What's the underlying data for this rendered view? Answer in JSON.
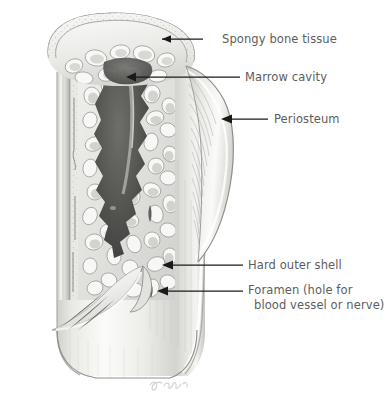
{
  "figure": {
    "signature": "J. Bonn",
    "background_color": "#ffffff",
    "ink_color": "#5d5d5d",
    "leader_color": "#1a1a1a"
  },
  "labels": [
    {
      "id": "spongy-bone-tissue",
      "text": "Spongy bone tissue",
      "lines": [
        "Spongy bone tissue"
      ],
      "x": 222,
      "y": 32,
      "leader": {
        "type": "line",
        "x1": 203,
        "y1": 39,
        "x2": 160,
        "y2": 39
      }
    },
    {
      "id": "marrow-cavity",
      "text": "Marrow cavity",
      "lines": [
        "Marrow cavity"
      ],
      "x": 245,
      "y": 70,
      "leader": {
        "type": "arrow",
        "x1": 240,
        "y1": 77,
        "x2": 126,
        "y2": 77
      }
    },
    {
      "id": "periosteum",
      "text": "Periosteum",
      "lines": [
        "Periosteum"
      ],
      "x": 274,
      "y": 112,
      "leader": {
        "type": "arrow",
        "x1": 268,
        "y1": 119,
        "x2": 222,
        "y2": 119
      }
    },
    {
      "id": "hard-outer-shell",
      "text": "Hard outer shell",
      "lines": [
        "Hard outer shell"
      ],
      "x": 248,
      "y": 258,
      "leader": {
        "type": "arrow",
        "x1": 243,
        "y1": 265,
        "x2": 163,
        "y2": 265
      }
    },
    {
      "id": "foramen",
      "text": "Foramen (hole for blood vessel or nerve)",
      "lines": [
        "Foramen (hole for",
        "blood vessel or nerve)"
      ],
      "x": 248,
      "y": 283,
      "leader": {
        "type": "arrow",
        "x1": 243,
        "y1": 291,
        "x2": 158,
        "y2": 291
      }
    }
  ],
  "structures": [
    {
      "id": "compact-bone-shaft",
      "name": "Hard outer shell (compact bone)"
    },
    {
      "id": "spongy-bone",
      "name": "Spongy bone tissue (trabeculae)"
    },
    {
      "id": "marrow-cavity",
      "name": "Marrow cavity"
    },
    {
      "id": "periosteum-flap",
      "name": "Periosteum (peeled back)"
    },
    {
      "id": "foramen-opening",
      "name": "Foramen"
    }
  ]
}
